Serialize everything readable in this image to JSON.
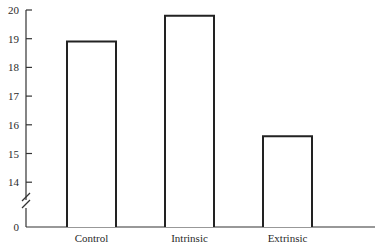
{
  "chart_data": {
    "type": "bar",
    "title": "",
    "xlabel": "",
    "ylabel": "",
    "categories": [
      "Control",
      "Intrinsic",
      "Extrinsic"
    ],
    "values": [
      18.9,
      19.8,
      15.6
    ],
    "ylim": [
      0,
      20
    ],
    "axis_break": true,
    "y_ticks": [
      20,
      19,
      18,
      17,
      16,
      15,
      14,
      0
    ],
    "grid": false,
    "legend": null
  },
  "style": {
    "bar_fill": "#ffffff",
    "bar_stroke": "#222222",
    "axis_color": "#333333"
  }
}
